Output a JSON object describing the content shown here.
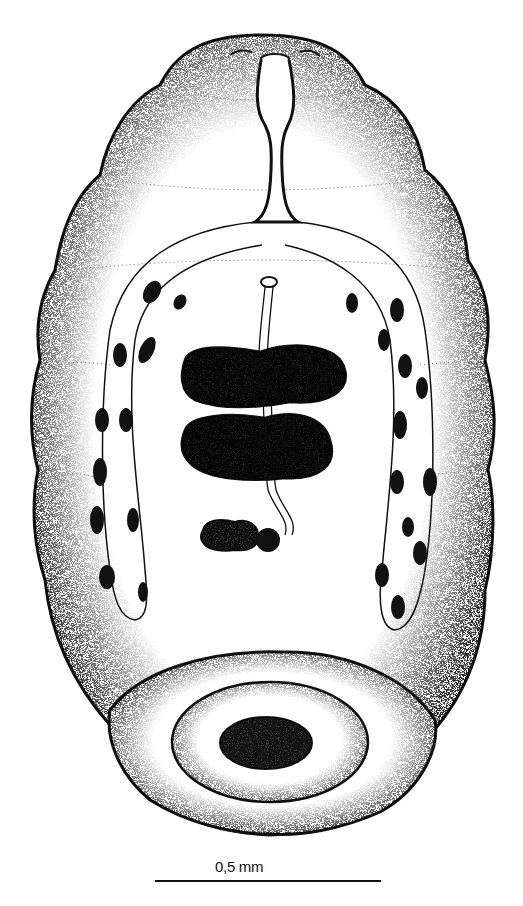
{
  "figure": {
    "colors": {
      "ink": "#111111",
      "background": "#ffffff"
    },
    "structures": [
      "oral-sucker",
      "pharynx",
      "intestinal-caeca",
      "genital-pore",
      "anterior-testis",
      "posterior-testis",
      "ovary",
      "ootype",
      "vitelline-follicles-left",
      "vitelline-follicles-right",
      "ventral-sucker-disc",
      "ventral-sucker-center",
      "body-tegument-folds"
    ]
  },
  "scale_bar": {
    "label": "0,5 mm"
  }
}
